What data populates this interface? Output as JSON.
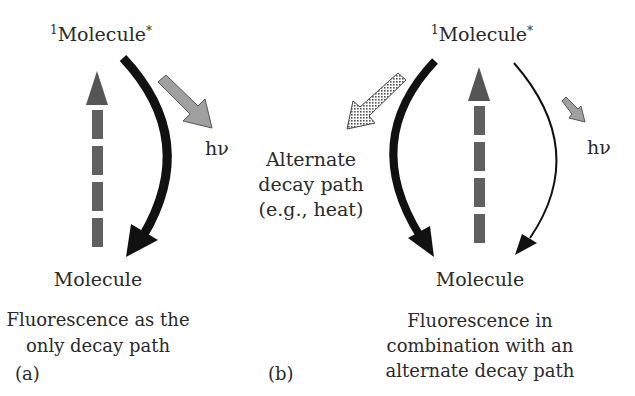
{
  "panel_a": {
    "excited_label": "Molecule",
    "excited_sup_left": "1",
    "excited_sup_right": "*",
    "ground_label": "Molecule",
    "photon_label": "hν",
    "caption_lines": [
      "Fluorescence as the",
      "only decay path"
    ],
    "panel_label": "(a)"
  },
  "panel_b": {
    "excited_label": "Molecule",
    "excited_sup_left": "1",
    "excited_sup_right": "*",
    "ground_label": "Molecule",
    "photon_label": "hν",
    "alternate_lines": [
      "Alternate",
      "decay path",
      "(e.g., heat)"
    ],
    "caption_lines": [
      "Fluorescence in",
      "combination with an",
      "alternate decay path"
    ],
    "panel_label": "(b)"
  },
  "colors": {
    "text": "#2a2a2a",
    "decay_arrow": "#111111",
    "excitation_arrow": "#555555",
    "photon_arrow": "#9a9a9a"
  }
}
